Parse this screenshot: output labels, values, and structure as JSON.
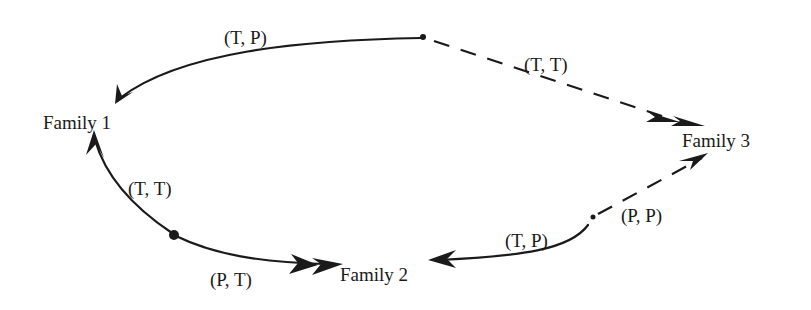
{
  "diagram": {
    "type": "state-transition",
    "nodes": [
      {
        "id": "family1",
        "label": "Family 1"
      },
      {
        "id": "family2",
        "label": "Family 2"
      },
      {
        "id": "family3",
        "label": "Family 3"
      }
    ],
    "edges": [
      {
        "id": "e_top_to_f1",
        "label": "(T, P)",
        "to": "family1",
        "style": "solid"
      },
      {
        "id": "e_top_to_f3",
        "label": "(T, T)",
        "to": "family3",
        "style": "dashed",
        "double_arrow": true
      },
      {
        "id": "e_left_to_f1",
        "label": "(T, T)",
        "to": "family1",
        "style": "solid"
      },
      {
        "id": "e_left_to_f2",
        "label": "(P, T)",
        "to": "family2",
        "style": "solid",
        "double_arrow": true
      },
      {
        "id": "e_right_to_f2",
        "label": "(T, P)",
        "to": "family2",
        "style": "solid"
      },
      {
        "id": "e_right_to_f3",
        "label": "(P, P)",
        "to": "family3",
        "style": "dashed"
      }
    ]
  }
}
